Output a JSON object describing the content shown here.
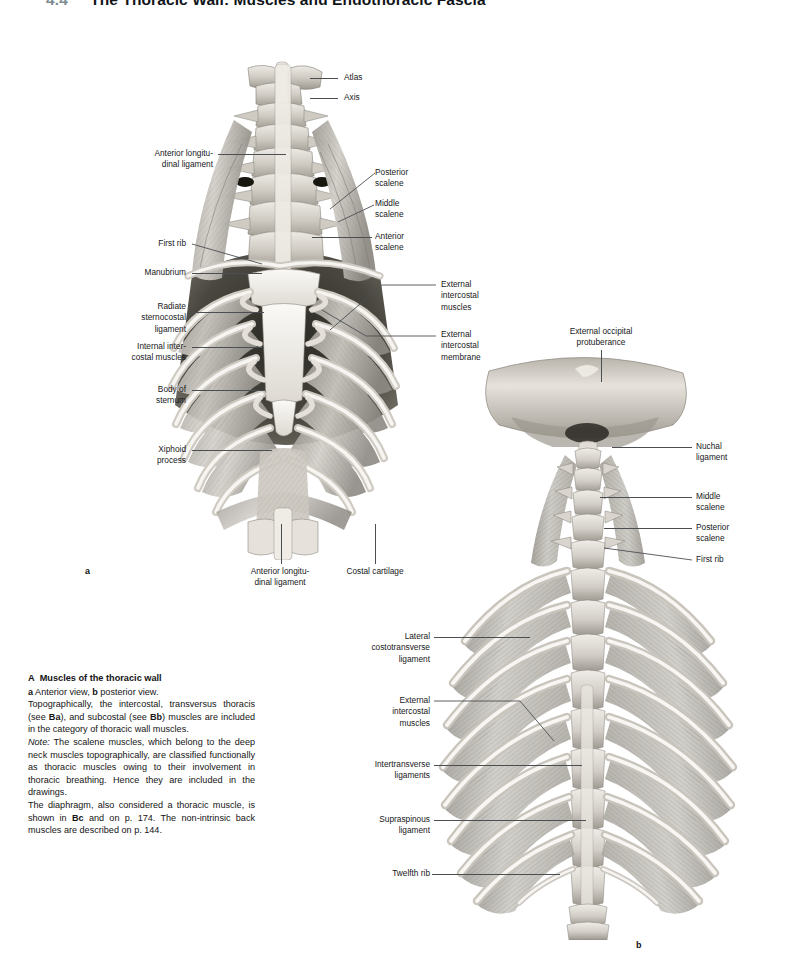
{
  "header": {
    "section_number": "4.4",
    "title": "The Thoracic Wall: Muscles and Endothoracic Fascia"
  },
  "figure_a": {
    "panel_letter": "a",
    "labels_left": [
      {
        "id": "anterior-longitudinal-ligament",
        "text": "Anterior longitu-\ndinal ligament"
      },
      {
        "id": "first-rib",
        "text": "First rib"
      },
      {
        "id": "manubrium",
        "text": "Manubrium"
      },
      {
        "id": "radiate-sternocostal-ligament",
        "text": "Radiate\nsternocostal\nligament"
      },
      {
        "id": "internal-intercostal-muscles",
        "text": "Internal inter-\ncostal muscles"
      },
      {
        "id": "body-of-sternum",
        "text": "Body of\nsternum"
      },
      {
        "id": "xiphoid-process",
        "text": "Xiphoid\nprocess"
      }
    ],
    "labels_right": [
      {
        "id": "atlas",
        "text": "Atlas"
      },
      {
        "id": "axis",
        "text": "Axis"
      },
      {
        "id": "posterior-scalene",
        "text": "Posterior\nscalene"
      },
      {
        "id": "middle-scalene",
        "text": "Middle\nscalene"
      },
      {
        "id": "anterior-scalene",
        "text": "Anterior\nscalene"
      },
      {
        "id": "external-intercostal-muscles",
        "text": "External\nintercostal\nmuscles"
      },
      {
        "id": "external-intercostal-membrane",
        "text": "External\nintercostal\nmembrane"
      }
    ],
    "labels_bottom": [
      {
        "id": "anterior-longitudinal-ligament-bottom",
        "text": "Anterior longitu-\ndinal ligament"
      },
      {
        "id": "costal-cartilage",
        "text": "Costal cartilage"
      }
    ]
  },
  "figure_b": {
    "panel_letter": "b",
    "labels_top": [
      {
        "id": "external-occipital-protuberance",
        "text": "External occipital\nprotuberance"
      }
    ],
    "labels_right": [
      {
        "id": "nuchal-ligament",
        "text": "Nuchal\nligament"
      },
      {
        "id": "middle-scalene",
        "text": "Middle\nscalene"
      },
      {
        "id": "posterior-scalene",
        "text": "Posterior\nscalene"
      },
      {
        "id": "first-rib",
        "text": "First rib"
      }
    ],
    "labels_left": [
      {
        "id": "lateral-costotransverse-ligament",
        "text": "Lateral\ncostotransverse\nligament"
      },
      {
        "id": "external-intercostal-muscles",
        "text": "External\nintercostal\nmuscles"
      },
      {
        "id": "intertransverse-ligaments",
        "text": "Intertransverse\nligaments"
      },
      {
        "id": "supraspinous-ligament",
        "text": "Supraspinous\nligament"
      },
      {
        "id": "twelfth-rib",
        "text": "Twelfth rib"
      }
    ]
  },
  "caption": {
    "letter": "A",
    "title": "Muscles of the thoracic wall",
    "line_views_a": "a",
    "line_views_a_text": " Anterior view, ",
    "line_views_b": "b",
    "line_views_b_text": " posterior view.",
    "para1_pre": "Topographically, the intercostal, transversus thoracis (see ",
    "para1_ref1": "Ba",
    "para1_mid": "), and subcostal (see ",
    "para1_ref2": "Bb",
    "para1_post": ") muscles are included in the category of thoracic wall muscles.",
    "note_label": "Note:",
    "para2": " The scalene muscles, which belong to the deep neck muscles topographically, are classified functionally as thoracic muscles owing to their involvement in thoracic breathing. Hence they are included in the drawings.",
    "para3_pre": "The diaphragm, also considered a thoracic muscle, is shown in ",
    "para3_ref": "Bc",
    "para3_mid": " and on p. 174. The non-intrinsic back muscles are described on p. 144."
  },
  "colors": {
    "page_background": "#ffffff",
    "label_text": "#17181a",
    "leader_line": "#4c4f52",
    "header_number": "#7d8b93",
    "header_title": "#111418",
    "bone_light": "#f2f0ec",
    "bone_mid": "#d8d4cd",
    "bone_shadow": "#9b968e",
    "muscle_light": "#cfcbc5",
    "muscle_mid": "#a8a49e",
    "cavity_dark": "#2e2d2b"
  }
}
